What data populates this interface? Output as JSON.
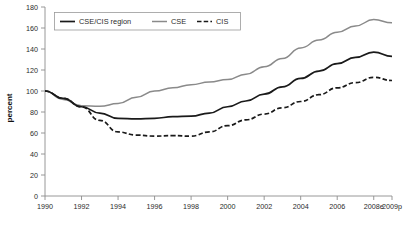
{
  "chart_data": {
    "type": "line",
    "title": "",
    "xlabel": "",
    "ylabel": "percent",
    "ylim": [
      0,
      180
    ],
    "ytick_step": 20,
    "yticks": [
      "0",
      "20",
      "40",
      "60",
      "80",
      "100",
      "120",
      "140",
      "160",
      "180"
    ],
    "grid": false,
    "legend_position": "top-left",
    "categories": [
      "1990",
      "1991",
      "1992",
      "1993",
      "1994",
      "1995",
      "1996",
      "1997",
      "1998",
      "1999",
      "2000",
      "2001",
      "2002",
      "2003",
      "2004",
      "2005",
      "2006",
      "2007",
      "2008e",
      "2009p"
    ],
    "xticks": [
      "1990",
      "1992",
      "1994",
      "1996",
      "1998",
      "2000",
      "2002",
      "2004",
      "2006",
      "2008e",
      "2009p"
    ],
    "series": [
      {
        "name": "CSE/CIS region",
        "style": "solid",
        "color": "#1a1a1a",
        "width": 1.7,
        "values": [
          100,
          93,
          85,
          79,
          74,
          73.5,
          74,
          75.5,
          76,
          79,
          85,
          90.5,
          97,
          104,
          112,
          119,
          126,
          132,
          137,
          133
        ]
      },
      {
        "name": "CSE",
        "style": "solid",
        "color": "#8a8a8a",
        "width": 1.5,
        "values": [
          100,
          92,
          86,
          85.5,
          88,
          94,
          100,
          103,
          106,
          108.5,
          111,
          116,
          123,
          131,
          141,
          148.5,
          156,
          162,
          168,
          165
        ]
      },
      {
        "name": "CIS",
        "style": "dashed",
        "color": "#1a1a1a",
        "width": 1.7,
        "values": [
          100,
          93,
          85,
          72,
          61,
          58,
          57,
          57.5,
          57,
          61,
          67,
          72.5,
          78,
          84,
          90,
          96.5,
          103,
          108,
          113,
          110
        ]
      }
    ]
  },
  "legend": {
    "items": [
      {
        "label": "CSE/CIS region"
      },
      {
        "label": "CSE"
      },
      {
        "label": "CIS"
      }
    ]
  },
  "axes": {
    "y_title": "percent"
  }
}
